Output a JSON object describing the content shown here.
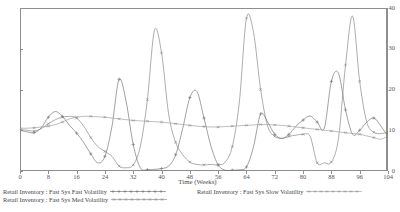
{
  "chart_data": {
    "type": "line",
    "title": "",
    "xlabel": "Time (Weeks)",
    "ylabel": "",
    "xlim": [
      0,
      104
    ],
    "ylim": [
      0,
      40
    ],
    "xticks": [
      0,
      8,
      16,
      24,
      32,
      40,
      48,
      56,
      64,
      72,
      80,
      88,
      96,
      104
    ],
    "yticks": [
      0,
      10,
      20,
      30,
      40
    ],
    "grid": false,
    "legend_position": "below",
    "series": [
      {
        "name": "Retail Inventory : Fast Sys Fast Volatility",
        "marker": "plus",
        "color": "#6e6e6e",
        "x": [
          0,
          2,
          4,
          6,
          8,
          10,
          12,
          14,
          16,
          18,
          20,
          22,
          24,
          26,
          28,
          30,
          32,
          34,
          36,
          38,
          40,
          42,
          44,
          46,
          48,
          50,
          52,
          54,
          56,
          58,
          60,
          62,
          64,
          66,
          68,
          70,
          72,
          74,
          76,
          78,
          80,
          82,
          84,
          86,
          88,
          90,
          92,
          94,
          96,
          98,
          100,
          102,
          104
        ],
        "values": [
          10.0,
          9.6,
          9.4,
          10.6,
          13.2,
          14.6,
          13.4,
          11.2,
          9.3,
          7.0,
          4.2,
          2.0,
          3.6,
          11.0,
          22.5,
          17.0,
          6.5,
          0.8,
          0.3,
          0.4,
          0.6,
          1.2,
          4.0,
          10.5,
          18.0,
          19.5,
          13.0,
          6.0,
          1.5,
          0.2,
          0.2,
          0.3,
          1.0,
          6.0,
          14.0,
          12.0,
          9.0,
          8.0,
          9.0,
          11.0,
          12.5,
          13.5,
          12.0,
          10.5,
          22.0,
          24.0,
          15.0,
          9.0,
          10.0,
          12.0,
          13.0,
          11.0,
          8.5
        ]
      },
      {
        "name": "Retail Inventory : Fast Sys Med Volatility",
        "marker": "cross",
        "color": "#808080",
        "x": [
          0,
          2,
          4,
          6,
          8,
          10,
          12,
          14,
          16,
          18,
          20,
          22,
          24,
          26,
          28,
          30,
          32,
          34,
          36,
          38,
          40,
          42,
          44,
          46,
          48,
          50,
          52,
          54,
          56,
          58,
          60,
          62,
          64,
          66,
          68,
          70,
          72,
          74,
          76,
          78,
          80,
          82,
          84,
          86,
          88,
          90,
          92,
          94,
          96,
          98,
          100,
          102,
          104
        ],
        "values": [
          10.2,
          10.0,
          9.8,
          10.4,
          11.6,
          12.6,
          13.2,
          13.4,
          13.0,
          11.0,
          8.2,
          6.0,
          4.8,
          3.6,
          1.2,
          0.8,
          1.5,
          6.0,
          17.5,
          34.5,
          29.0,
          14.0,
          7.0,
          4.0,
          2.2,
          1.6,
          1.5,
          1.6,
          1.5,
          2.2,
          6.0,
          17.0,
          37.5,
          34.0,
          20.0,
          11.0,
          8.5,
          8.0,
          8.5,
          8.8,
          9.0,
          8.5,
          2.0,
          2.0,
          2.2,
          8.0,
          26.0,
          38.0,
          22.0,
          12.0,
          9.5,
          9.2,
          9.5
        ]
      },
      {
        "name": "Retail Inventory : Fast Sys Slow Volatility",
        "marker": "star",
        "color": "#9a9a9a",
        "x": [
          0,
          2,
          4,
          6,
          8,
          10,
          12,
          14,
          16,
          18,
          20,
          22,
          24,
          26,
          28,
          30,
          32,
          34,
          36,
          38,
          40,
          42,
          44,
          46,
          48,
          50,
          52,
          54,
          56,
          58,
          60,
          62,
          64,
          66,
          68,
          70,
          72,
          74,
          76,
          78,
          80,
          82,
          84,
          86,
          88,
          90,
          92,
          94,
          96,
          98,
          100,
          102,
          104
        ],
        "values": [
          10.5,
          10.5,
          10.6,
          10.8,
          11.0,
          11.4,
          12.0,
          12.8,
          13.2,
          13.4,
          13.4,
          13.3,
          13.2,
          13.0,
          12.8,
          12.6,
          12.4,
          12.3,
          12.2,
          12.1,
          12.0,
          11.8,
          11.6,
          11.4,
          11.2,
          11.0,
          10.9,
          10.8,
          10.8,
          10.9,
          11.0,
          11.1,
          11.2,
          11.3,
          11.4,
          11.4,
          11.3,
          11.2,
          11.0,
          10.8,
          10.6,
          10.4,
          10.2,
          10.0,
          9.8,
          9.6,
          9.4,
          9.2,
          9.0,
          8.6,
          8.2,
          7.8,
          8.6
        ]
      }
    ]
  },
  "legend": {
    "entries": [
      {
        "label": "Retail Inventory : Fast Sys Fast Volatility"
      },
      {
        "label": "Retail Inventory : Fast Sys Med Volatility"
      },
      {
        "label": "Retail Inventory : Fast Sys Slow Volatility"
      }
    ]
  },
  "colors": {
    "frame": "#8e8e8e",
    "text": "#444444",
    "background": "#ffffff"
  }
}
